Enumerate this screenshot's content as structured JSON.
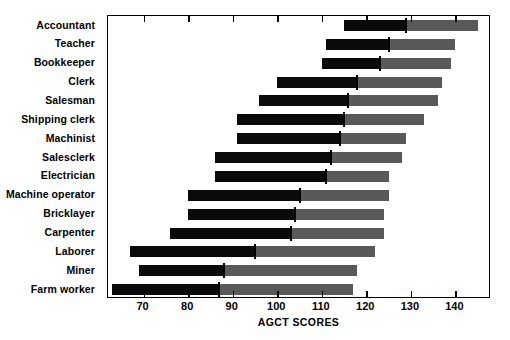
{
  "chart_data": {
    "type": "bar",
    "title": "",
    "subtitle": "",
    "xlabel": "AGCT SCORES",
    "ylabel": "",
    "xlim": [
      62,
      148
    ],
    "xticks": [
      70,
      80,
      90,
      100,
      110,
      120,
      130,
      140
    ],
    "xtick_labels": [
      "70",
      "80",
      "90",
      "100",
      "110",
      "120",
      "130",
      "140"
    ],
    "grid": false,
    "legend": null,
    "orientation": "horizontal",
    "note": "Each row is a range bar: black segment spans the lower range, gray segment spans the upper range, and a vertical tick marks the median score.",
    "colors": {
      "low_range": "#0a0a0a",
      "high_range": "#595959",
      "median_marker": "#000000",
      "axis": "#000000",
      "background": "#ffffff"
    },
    "series": [
      {
        "name": "range_low",
        "label": "Lower range start"
      },
      {
        "name": "median",
        "label": "Median"
      },
      {
        "name": "range_high",
        "label": "Upper range end"
      }
    ],
    "categories": [
      "Accountant",
      "Teacher",
      "Bookkeeper",
      "Clerk",
      "Salesman",
      "Shipping clerk",
      "Machinist",
      "Salesclerk",
      "Electrician",
      "Machine operator",
      "Bricklayer",
      "Carpenter",
      "Laborer",
      "Miner",
      "Farm worker"
    ],
    "rows": [
      {
        "category": "Accountant",
        "low": 115,
        "median": 129,
        "high": 145
      },
      {
        "category": "Teacher",
        "low": 111,
        "median": 125,
        "high": 140
      },
      {
        "category": "Bookkeeper",
        "low": 110,
        "median": 123,
        "high": 139
      },
      {
        "category": "Clerk",
        "low": 100,
        "median": 118,
        "high": 137
      },
      {
        "category": "Salesman",
        "low": 96,
        "median": 116,
        "high": 136
      },
      {
        "category": "Shipping clerk",
        "low": 91,
        "median": 115,
        "high": 133
      },
      {
        "category": "Machinist",
        "low": 91,
        "median": 114,
        "high": 129
      },
      {
        "category": "Salesclerk",
        "low": 86,
        "median": 112,
        "high": 128
      },
      {
        "category": "Electrician",
        "low": 86,
        "median": 111,
        "high": 125
      },
      {
        "category": "Machine operator",
        "low": 80,
        "median": 105,
        "high": 125
      },
      {
        "category": "Bricklayer",
        "low": 80,
        "median": 104,
        "high": 124
      },
      {
        "category": "Carpenter",
        "low": 76,
        "median": 103,
        "high": 124
      },
      {
        "category": "Laborer",
        "low": 67,
        "median": 95,
        "high": 122
      },
      {
        "category": "Miner",
        "low": 69,
        "median": 88,
        "high": 118
      },
      {
        "category": "Farm worker",
        "low": 63,
        "median": 87,
        "high": 117
      }
    ]
  }
}
